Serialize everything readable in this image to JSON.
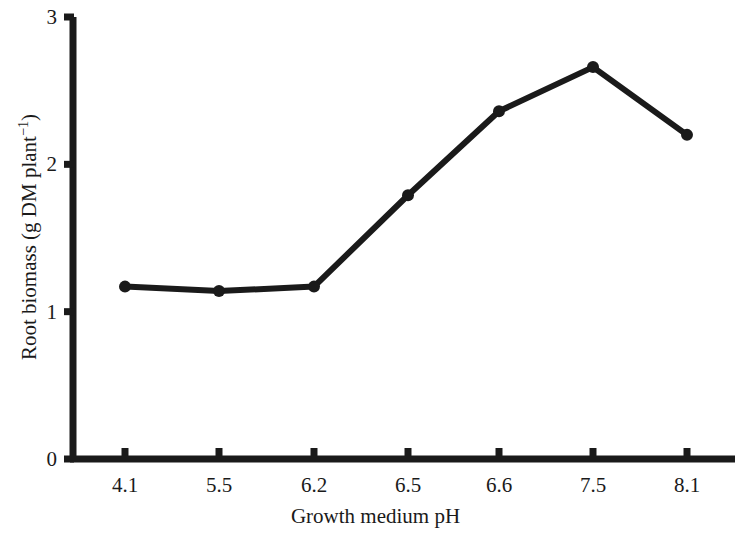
{
  "chart_data": {
    "type": "line",
    "title": "",
    "xlabel": "Growth medium pH",
    "ylabel": "Root biomass (g DM plant⁻¹)",
    "ylabel_base": "Root biomass (g DM plant",
    "ylabel_exponent": "−1",
    "ylabel_tail": ")",
    "categories": [
      "4.1",
      "5.5",
      "6.2",
      "6.5",
      "6.6",
      "7.5",
      "8.1"
    ],
    "values": [
      1.17,
      1.14,
      1.17,
      1.79,
      2.36,
      2.66,
      2.2
    ],
    "x_tick_labels": [
      "4.1",
      "5.5",
      "6.2",
      "6.5",
      "6.6",
      "7.5",
      "8.1"
    ],
    "y_tick_labels": [
      "0",
      "1",
      "2",
      "3"
    ],
    "y_tick_values": [
      0,
      1,
      2,
      3
    ],
    "ylim": [
      0,
      3
    ],
    "grid": false,
    "legend": null,
    "series_color": "#1a1a1a",
    "marker": "circle",
    "marker_size": 9,
    "line_width": 6,
    "axis_color": "#1a1a1a",
    "background_color": "#ffffff"
  },
  "geometry": {
    "plot_left": 73,
    "plot_right": 735,
    "plot_bottom": 459,
    "plot_top": 17,
    "tick_x_positions": [
      125,
      203,
      281,
      359,
      437,
      515,
      593,
      687
    ],
    "data_x_positions": [
      125,
      219,
      314,
      408,
      499,
      593,
      687
    ],
    "y_zero": 459,
    "y_one": 313,
    "y_two": 167,
    "y_three": 17
  }
}
